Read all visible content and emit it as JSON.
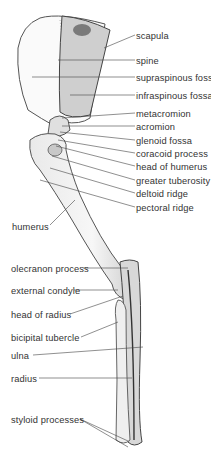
{
  "figure": {
    "labels_right": [
      {
        "text": "scapula",
        "x": 136,
        "y": 31
      },
      {
        "text": "spine",
        "x": 136,
        "y": 56
      },
      {
        "text": "supraspinous fossa",
        "x": 136,
        "y": 73
      },
      {
        "text": "infraspinous fossa",
        "x": 136,
        "y": 91
      },
      {
        "text": "metacromion",
        "x": 136,
        "y": 109
      },
      {
        "text": "acromion",
        "x": 136,
        "y": 122
      },
      {
        "text": "glenoid fossa",
        "x": 136,
        "y": 136
      },
      {
        "text": "coracoid process",
        "x": 136,
        "y": 149
      },
      {
        "text": "head of humerus",
        "x": 136,
        "y": 162
      },
      {
        "text": "greater tuberosity",
        "x": 136,
        "y": 176
      },
      {
        "text": "deltoid ridge",
        "x": 136,
        "y": 189
      },
      {
        "text": "pectoral ridge",
        "x": 136,
        "y": 203
      }
    ],
    "labels_left": [
      {
        "text": "humerus",
        "x": 12,
        "y": 222
      },
      {
        "text": "olecranon process",
        "x": 11,
        "y": 264
      },
      {
        "text": "external condyle",
        "x": 11,
        "y": 286
      },
      {
        "text": "head of radius",
        "x": 11,
        "y": 310
      },
      {
        "text": "bicipital tubercle",
        "x": 11,
        "y": 333
      },
      {
        "text": "ulna",
        "x": 11,
        "y": 351
      },
      {
        "text": "radius",
        "x": 11,
        "y": 374
      },
      {
        "text": "styloid processes",
        "x": 11,
        "y": 415
      }
    ]
  }
}
